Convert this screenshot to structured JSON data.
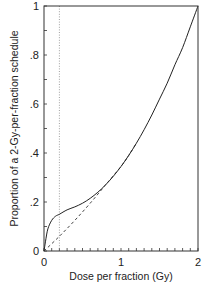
{
  "chart_data": {
    "type": "line",
    "title": "",
    "xlabel": "Dose per fraction  (Gy)",
    "ylabel": "Proportion of a 2-Gy-per-fraction schedule",
    "xlim": [
      0,
      2
    ],
    "ylim": [
      0,
      1
    ],
    "grid": false,
    "legend": null,
    "x_ticks": [
      0,
      1,
      2
    ],
    "x_tick_labels": [
      "0",
      "1",
      "2"
    ],
    "x_minor_tick_step": 0.1,
    "y_ticks": [
      0,
      0.2,
      0.4,
      0.6,
      0.8,
      1
    ],
    "y_tick_labels": [
      "0",
      ".2",
      ".4",
      ".6",
      ".8",
      "1"
    ],
    "y_minor_tick_step": 0.1,
    "reference_line": {
      "orientation": "vertical",
      "x": 0.2,
      "style": "dotted"
    },
    "series": [
      {
        "name": "solid curve",
        "style": "solid",
        "x": [
          0,
          0.02,
          0.05,
          0.1,
          0.15,
          0.2,
          0.3,
          0.4,
          0.5,
          0.6,
          0.7,
          0.8,
          0.9,
          1.0,
          1.1,
          1.2,
          1.3,
          1.4,
          1.5,
          1.6,
          1.7,
          1.8,
          1.9,
          2.0
        ],
        "values": [
          0,
          0.04,
          0.09,
          0.125,
          0.142,
          0.15,
          0.168,
          0.18,
          0.195,
          0.215,
          0.24,
          0.27,
          0.305,
          0.345,
          0.39,
          0.44,
          0.495,
          0.555,
          0.62,
          0.685,
          0.76,
          0.83,
          0.915,
          1.0
        ]
      },
      {
        "name": "dashed curve",
        "style": "dashed",
        "x": [
          0,
          0.2,
          0.4,
          0.6,
          0.8,
          1.0,
          1.1,
          1.2
        ],
        "values": [
          0,
          0.06,
          0.125,
          0.195,
          0.27,
          0.345,
          0.39,
          0.44
        ]
      }
    ]
  }
}
